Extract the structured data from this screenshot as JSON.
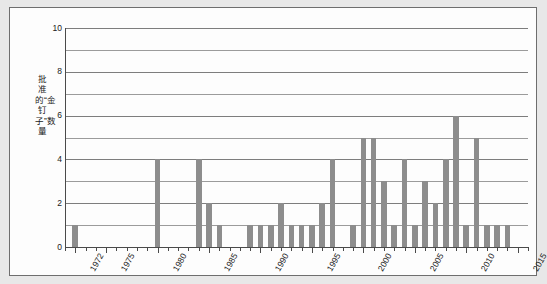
{
  "chart_data": {
    "type": "bar",
    "title": "",
    "subtitle": "",
    "xlabel": "",
    "ylabel": "批准的“金钉子”数量",
    "ylim": [
      0,
      10
    ],
    "xlim": [
      1971,
      2016
    ],
    "grid": true,
    "legend": null,
    "bar_color": "#8d8d8d",
    "y_ticks": [
      0,
      2,
      4,
      6,
      8,
      10
    ],
    "y_tick_labels": [
      "0",
      "2",
      "4",
      "6",
      "8",
      "10"
    ],
    "y_gridlines": [
      1,
      2,
      3,
      4,
      5,
      6,
      7,
      8,
      9,
      10
    ],
    "x_tick_labels": [
      "1972",
      "1975",
      "1980",
      "1985",
      "1990",
      "1995",
      "2000",
      "2005",
      "2010",
      "2015"
    ],
    "x_tick_values": [
      1972,
      1975,
      1980,
      1985,
      1990,
      1995,
      2000,
      2005,
      2010,
      2015
    ],
    "categories": [
      1972,
      1973,
      1974,
      1975,
      1976,
      1977,
      1978,
      1979,
      1980,
      1981,
      1982,
      1983,
      1984,
      1985,
      1986,
      1987,
      1988,
      1989,
      1990,
      1991,
      1992,
      1993,
      1994,
      1995,
      1996,
      1997,
      1998,
      1999,
      2000,
      2001,
      2002,
      2003,
      2004,
      2005,
      2006,
      2007,
      2008,
      2009,
      2010,
      2011,
      2012,
      2013,
      2014,
      2015
    ],
    "values": [
      1,
      0,
      0,
      0,
      0,
      0,
      0,
      0,
      4,
      0,
      0,
      0,
      4,
      2,
      1,
      0,
      0,
      1,
      1,
      1,
      2,
      1,
      1,
      1,
      2,
      4,
      0,
      1,
      5,
      5,
      3,
      1,
      4,
      1,
      3,
      2,
      4,
      6,
      1,
      5,
      1,
      1,
      1,
      0
    ]
  },
  "chart_frame": {
    "background": "#fdfdfd",
    "page_background": "#e8e8e8",
    "border_color": "#6e6e6e"
  }
}
